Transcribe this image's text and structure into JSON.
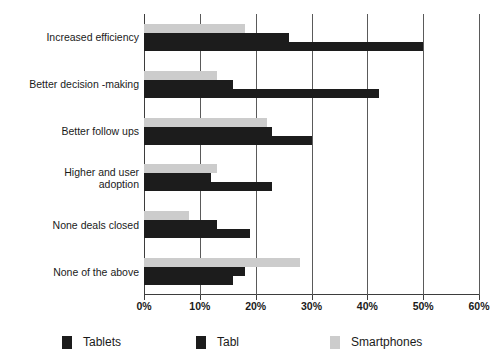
{
  "chart_data": {
    "type": "bar",
    "orientation": "horizontal",
    "title": "",
    "xlabel": "",
    "ylabel": "",
    "xlim": [
      0,
      60
    ],
    "xtick_labels": [
      "0%",
      "10%",
      "20%",
      "30%",
      "40%",
      "50%",
      "60%"
    ],
    "xticks": [
      0,
      10,
      20,
      30,
      40,
      50,
      60
    ],
    "grid": true,
    "legend_position": "bottom",
    "categories": [
      "Increased efficiency",
      "Better decision -making",
      "Better follow ups",
      "Higher and user\nadoption",
      "None deals closed",
      "None of the above"
    ],
    "series": [
      {
        "name": "Tablets",
        "color": "#1c1c1c",
        "values": [
          50,
          42,
          30,
          23,
          19,
          16
        ]
      },
      {
        "name": "Tabl",
        "color": "#1c1c1c",
        "values": [
          26,
          16,
          23,
          12,
          13,
          18
        ]
      },
      {
        "name": "Smartphones",
        "color": "#cccccc",
        "values": [
          18,
          13,
          22,
          13,
          8,
          28
        ]
      }
    ]
  },
  "legend": {
    "items": [
      {
        "label": "Tablets",
        "swatch": "dark"
      },
      {
        "label": "Tabl",
        "swatch": "dark"
      },
      {
        "label": "Smartphones",
        "swatch": "gray"
      }
    ]
  },
  "colors": {
    "series_dark": "#1c1c1c",
    "series_gray": "#cccccc",
    "axis": "#3d3d3d",
    "grid": "#5a5a5a",
    "background": "#ffffff"
  }
}
